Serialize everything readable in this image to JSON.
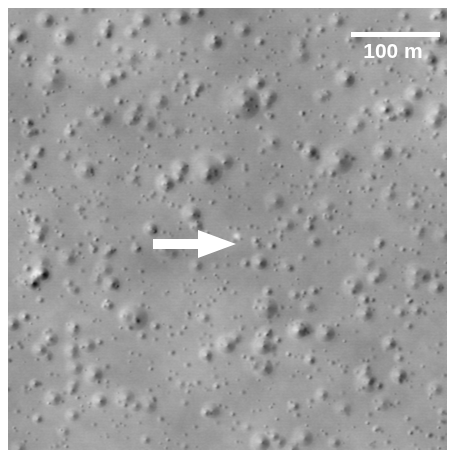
{
  "figure": {
    "kind": "remote-sensing-image",
    "background_color": "#ffffff",
    "panel": {
      "x": 8,
      "y": 8,
      "width": 439,
      "height": 442,
      "base_gray": "#9b9b9b",
      "illumination": "from-left",
      "grain_intensity": 0.09
    }
  },
  "annotations": {
    "scalebar": {
      "label": "100 m",
      "color": "#ffffff",
      "bar_length_px": 89,
      "bar_thickness_px": 5,
      "position": "top-right"
    },
    "arrow": {
      "label": "",
      "color": "#ffffff",
      "direction": "right",
      "points_to": "small-bright-feature",
      "shaft_length_px": 48,
      "head_length_px": 40,
      "position": "center-left"
    }
  },
  "surface_features": {
    "large_craters": [
      {
        "x": 236,
        "y": 95,
        "r": 17,
        "depth": 0.62
      },
      {
        "x": 200,
        "y": 162,
        "r": 15,
        "depth": 0.58
      },
      {
        "x": 127,
        "y": 310,
        "r": 13,
        "depth": 0.52
      },
      {
        "x": 331,
        "y": 153,
        "r": 14,
        "depth": 0.6
      },
      {
        "x": 395,
        "y": 102,
        "r": 11,
        "depth": 0.55
      },
      {
        "x": 430,
        "y": 104,
        "r": 10,
        "depth": 0.5
      },
      {
        "x": 44,
        "y": 72,
        "r": 14,
        "depth": 0.45
      },
      {
        "x": 78,
        "y": 162,
        "r": 9,
        "depth": 0.55
      },
      {
        "x": 259,
        "y": 300,
        "r": 11,
        "depth": 0.56
      },
      {
        "x": 360,
        "y": 375,
        "r": 10,
        "depth": 0.52
      },
      {
        "x": 118,
        "y": 390,
        "r": 9,
        "depth": 0.48
      },
      {
        "x": 296,
        "y": 430,
        "r": 9,
        "depth": 0.5
      },
      {
        "x": 415,
        "y": 268,
        "r": 8,
        "depth": 0.5
      },
      {
        "x": 346,
        "y": 278,
        "r": 9,
        "depth": 0.52
      },
      {
        "x": 60,
        "y": 250,
        "r": 8,
        "depth": 0.46
      }
    ],
    "dark_patches": [
      {
        "x": 200,
        "y": 410,
        "rx": 42,
        "ry": 30,
        "strength": 0.2
      },
      {
        "x": 150,
        "y": 255,
        "rx": 36,
        "ry": 22,
        "strength": 0.16
      },
      {
        "x": 262,
        "y": 300,
        "rx": 30,
        "ry": 20,
        "strength": 0.14
      },
      {
        "x": 108,
        "y": 105,
        "rx": 34,
        "ry": 24,
        "strength": 0.12
      },
      {
        "x": 330,
        "y": 320,
        "rx": 40,
        "ry": 26,
        "strength": 0.1
      }
    ],
    "bright_patches": [
      {
        "x": 230,
        "y": 228,
        "rx": 22,
        "ry": 16,
        "strength": 0.13
      },
      {
        "x": 60,
        "y": 60,
        "rx": 30,
        "ry": 22,
        "strength": 0.1
      },
      {
        "x": 390,
        "y": 190,
        "rx": 34,
        "ry": 26,
        "strength": 0.08
      }
    ],
    "small_crater_count": 520,
    "speck_count": 900,
    "bright_spot": {
      "x": 228,
      "y": 228,
      "r": 3,
      "note": "arrow-target"
    }
  }
}
